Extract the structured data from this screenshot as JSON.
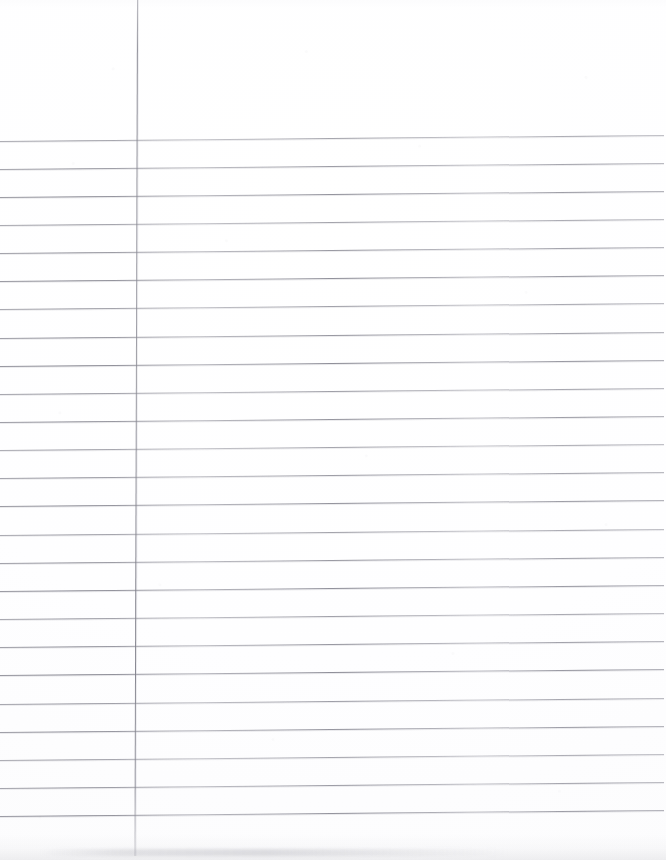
{
  "document": {
    "kind": "lined-paper-scan",
    "title": "Blank ruled notebook paper",
    "page_width": 666,
    "page_height": 860,
    "background_color": "#ffffff",
    "text_content": "",
    "handwriting_present": false,
    "printed_text_present": false
  },
  "ruling": {
    "line_color": "#8a8a94",
    "line_thickness_px": 1,
    "first_line_y": 140.5,
    "line_spacing_px": 28.15,
    "line_count": 25,
    "skew_degrees": -0.52,
    "line_start_x": 0,
    "line_end_x": 664,
    "header_space_px": 140,
    "footer_space_px": 45
  },
  "margin_rule": {
    "label": "vertical margin line",
    "color": "#80808b",
    "x_top": 136.5,
    "x_bottom": 139,
    "y_start": 0,
    "y_end": 856,
    "thickness_px": 1,
    "skew_degrees": 0.17
  },
  "scan_artifacts": {
    "noise": "faint grey speckle",
    "bottom_edge_smudge": "light grey band along bottom edge",
    "paper_tone": "#fefeff"
  }
}
